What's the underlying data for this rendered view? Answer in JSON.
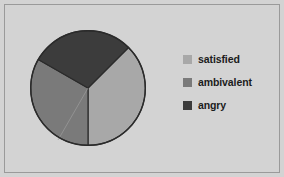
{
  "figure": {
    "background_color": "#d3d3d3",
    "border_color": "#9a9a9a"
  },
  "legend": {
    "position": "right",
    "items": [
      {
        "label": "satisfied",
        "color": "#a8a8a8",
        "swatch_name": "legend-swatch-satisfied"
      },
      {
        "label": "ambivalent",
        "color": "#7a7a7a",
        "swatch_name": "legend-swatch-ambivalent"
      },
      {
        "label": "angry",
        "color": "#3c3c3c",
        "swatch_name": "legend-swatch-angry"
      }
    ]
  },
  "chart_data": {
    "type": "pie",
    "title": "",
    "categories": [
      "satisfied",
      "ambivalent",
      "angry"
    ],
    "values": [
      37.5,
      33.3,
      29.2
    ],
    "colors": [
      "#a8a8a8",
      "#7a7a7a",
      "#3c3c3c"
    ],
    "labels_shown": false,
    "legend_entries": [
      "satisfied",
      "ambivalent",
      "angry"
    ],
    "legend_position": "right",
    "start_angle_deg": 45,
    "direction": "clockwise",
    "outline_color": "#2b2b2b",
    "center": {
      "x": 88,
      "y": 88
    },
    "radius": 58
  }
}
